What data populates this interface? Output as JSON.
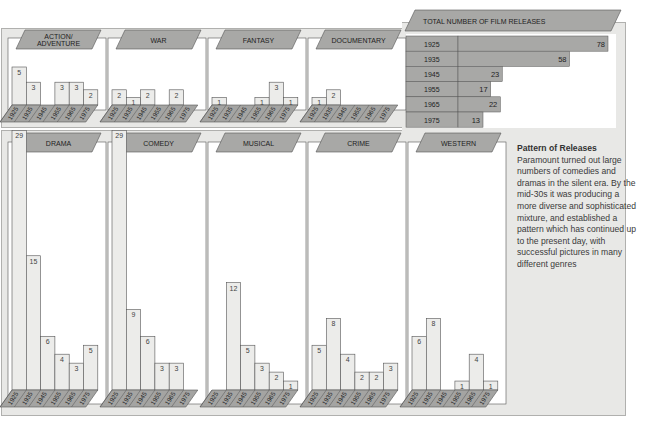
{
  "chart_data": [
    {
      "type": "bar",
      "title": "Film releases by genre",
      "categories": [
        "1925",
        "1935",
        "1945",
        "1955",
        "1965",
        "1975"
      ],
      "series": [
        {
          "name": "ACTION/ ADVENTURE",
          "values": [
            5,
            3,
            0,
            3,
            3,
            2
          ]
        },
        {
          "name": "WAR",
          "values": [
            2,
            1,
            2,
            0,
            2,
            0
          ]
        },
        {
          "name": "FANTASY",
          "values": [
            1,
            0,
            0,
            1,
            3,
            1
          ]
        },
        {
          "name": "DOCUMENTARY",
          "values": [
            1,
            2,
            0,
            0,
            0,
            0
          ]
        },
        {
          "name": "DRAMA",
          "values": [
            29,
            15,
            6,
            4,
            3,
            5
          ]
        },
        {
          "name": "COMEDY",
          "values": [
            29,
            9,
            6,
            3,
            3,
            0
          ]
        },
        {
          "name": "MUSICAL",
          "values": [
            0,
            12,
            5,
            3,
            2,
            1
          ]
        },
        {
          "name": "CRIME",
          "values": [
            5,
            8,
            4,
            2,
            2,
            3
          ]
        },
        {
          "name": "WESTERN",
          "values": [
            6,
            8,
            0,
            1,
            4,
            1
          ]
        }
      ],
      "xlabel": "",
      "ylabel": "",
      "grid": false
    },
    {
      "type": "bar",
      "orientation": "horizontal",
      "title": "TOTAL NUMBER OF FILM RELEASES",
      "categories": [
        "1925",
        "1935",
        "1945",
        "1955",
        "1965",
        "1975"
      ],
      "values": [
        78,
        58,
        23,
        17,
        22,
        13
      ]
    }
  ],
  "top_genres": [
    {
      "label1": "ACTION/",
      "label2": "ADVENTURE",
      "values": [
        5,
        3,
        0,
        3,
        3,
        2
      ]
    },
    {
      "label1": "WAR",
      "label2": "",
      "values": [
        2,
        1,
        2,
        0,
        2,
        0
      ]
    },
    {
      "label1": "FANTASY",
      "label2": "",
      "values": [
        1,
        0,
        0,
        1,
        3,
        1
      ]
    },
    {
      "label1": "DOCUMENTARY",
      "label2": "",
      "values": [
        1,
        2,
        0,
        0,
        0,
        0
      ]
    }
  ],
  "bottom_genres": [
    {
      "label1": "DRAMA",
      "values": [
        29,
        15,
        6,
        4,
        3,
        5
      ]
    },
    {
      "label1": "COMEDY",
      "values": [
        29,
        9,
        6,
        3,
        3,
        0
      ]
    },
    {
      "label1": "MUSICAL",
      "values": [
        0,
        12,
        5,
        3,
        2,
        1
      ]
    },
    {
      "label1": "CRIME",
      "values": [
        5,
        8,
        4,
        2,
        2,
        3
      ]
    },
    {
      "label1": "WESTERN",
      "values": [
        6,
        8,
        0,
        1,
        4,
        1
      ]
    }
  ],
  "years": [
    "1925",
    "1935",
    "1945",
    "1955",
    "1965",
    "1975"
  ],
  "totals": {
    "title": "TOTAL NUMBER OF FILM RELEASES",
    "rows": [
      {
        "year": "1925",
        "value": 78
      },
      {
        "year": "1935",
        "value": 58
      },
      {
        "year": "1945",
        "value": 23
      },
      {
        "year": "1955",
        "value": 17
      },
      {
        "year": "1965",
        "value": 22
      },
      {
        "year": "1975",
        "value": 13
      }
    ]
  },
  "caption": {
    "title": "Pattern of Releases",
    "body": "Paramount turned out large numbers of comedies and dramas in the silent era. By the mid-30s it was producing a more diverse and sophisticated mixture, and established a pattern which has continued up to the present day, with successful pictures in many different genres"
  },
  "colors": {
    "panel_bg": "#e8e8e6",
    "label_tab": "#a8a8a6",
    "bar_fill": "#ececea",
    "base_fill": "#a4a4a2",
    "stroke": "#555555",
    "total_bar": "#a8a8a6"
  }
}
